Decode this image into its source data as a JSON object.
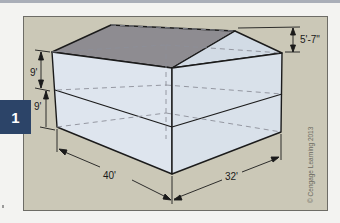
{
  "figure": {
    "badge_number": "1",
    "dimensions": {
      "lower_story_height": "9'",
      "upper_story_height": "9'",
      "roof_rise": "5'-7\"",
      "length": "40'",
      "width": "32'"
    },
    "copyright": "© Cengage Learning 2013",
    "colors": {
      "panel_background": "#cbc8b7",
      "roof_slope": "#8e8c91",
      "wall_fill": "#dde4ec",
      "gable_fill": "#d2dbe5",
      "badge": "#2c4468",
      "outline": "#1b1b1b"
    }
  }
}
